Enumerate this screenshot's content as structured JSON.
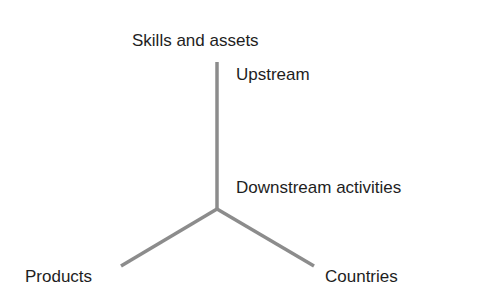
{
  "diagram": {
    "axes": {
      "vertical_top": "Skills and assets",
      "vertical_upper_note": "Upstream",
      "vertical_lower_note": "Downstream activities",
      "left_branch": "Products",
      "right_branch": "Countries"
    },
    "line_color": "#8c8c8c",
    "text_color": "#1e1e1e"
  }
}
